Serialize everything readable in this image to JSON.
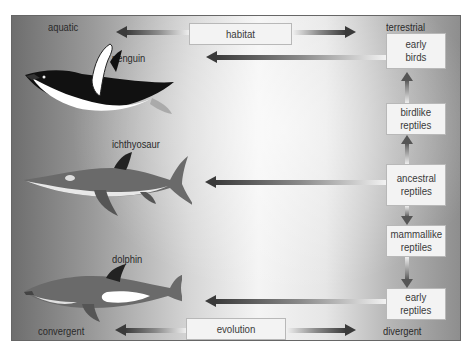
{
  "axes": {
    "habitat": {
      "label": "habitat",
      "left_end": "aquatic",
      "right_end": "terrestrial"
    },
    "evolution": {
      "label": "evolution",
      "left_end": "convergent",
      "right_end": "divergent"
    }
  },
  "animals": [
    {
      "name": "penguin",
      "icon": "penguin-icon"
    },
    {
      "name": "ichthyosaur",
      "icon": "ichthyosaur-icon"
    },
    {
      "name": "dolphin",
      "icon": "dolphin-icon"
    }
  ],
  "lineage": [
    {
      "label": "early\nbirds"
    },
    {
      "label": "birdlike\nreptiles"
    },
    {
      "label": "ancestral\nreptiles"
    },
    {
      "label": "mammallike\nreptiles"
    },
    {
      "label": "early\nreptiles"
    }
  ],
  "links": [
    {
      "from": "early birds",
      "to": "penguin"
    },
    {
      "from": "ancestral reptiles",
      "to": "ichthyosaur"
    },
    {
      "from": "early reptiles",
      "to": "dolphin"
    },
    {
      "from": "ancestral reptiles",
      "to": "birdlike reptiles"
    },
    {
      "from": "birdlike reptiles",
      "to": "early birds"
    },
    {
      "from": "ancestral reptiles",
      "to": "mammallike reptiles"
    },
    {
      "from": "mammallike reptiles",
      "to": "early reptiles"
    }
  ],
  "colors": {
    "frame_dark": "#6e6e6e",
    "frame_light": "#f4f4f4",
    "box_fill": "#f3f3f3",
    "arrow_dark": "#3a3a3a",
    "text": "#2a2a2a"
  }
}
